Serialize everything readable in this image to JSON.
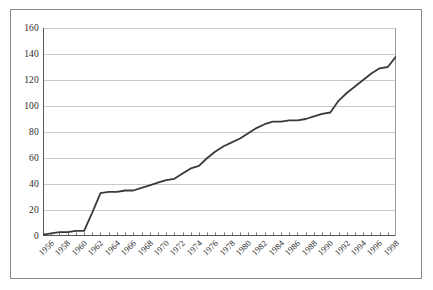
{
  "chart_data": {
    "type": "line",
    "title": "",
    "subtitle": "",
    "xlabel": "",
    "ylabel": "",
    "legend": [],
    "legend_position": "none",
    "grid": true,
    "grid_axis": "y",
    "xlim": [
      1956,
      1999
    ],
    "ylim": [
      0,
      160
    ],
    "ytick_values": [
      0,
      20,
      40,
      60,
      80,
      100,
      120,
      140,
      160
    ],
    "ytick_labels": [
      "0",
      "20",
      "40",
      "60",
      "80",
      "100",
      "120",
      "140",
      "160"
    ],
    "xtick_labels": [
      "1956",
      "1958",
      "1960",
      "1962",
      "1964",
      "1966",
      "1968",
      "1970",
      "1972",
      "1974",
      "1976",
      "1978",
      "1980",
      "1982",
      "1984",
      "1986",
      "1988",
      "1990",
      "1992",
      "1994",
      "1996",
      "1998"
    ],
    "xtick_step_years": 2,
    "minor_xticks_every_year": true,
    "line_color": "#3a3a3a",
    "grid_color": "#c9c9c9",
    "axis_color": "#555555",
    "frame_color": "#8a8a8a",
    "background_color": "#ffffff",
    "x": [
      1956,
      1957,
      1958,
      1959,
      1960,
      1961,
      1962,
      1963,
      1964,
      1965,
      1966,
      1967,
      1968,
      1969,
      1970,
      1971,
      1972,
      1973,
      1974,
      1975,
      1976,
      1977,
      1978,
      1979,
      1980,
      1981,
      1982,
      1983,
      1984,
      1985,
      1986,
      1987,
      1988,
      1989,
      1990,
      1991,
      1992,
      1993,
      1994,
      1995,
      1996,
      1997,
      1998,
      1999
    ],
    "series": [
      {
        "name": "cumulative total",
        "values": [
          1,
          2,
          3,
          3,
          4,
          4,
          18,
          33,
          34,
          34,
          35,
          35,
          37,
          39,
          41,
          43,
          44,
          48,
          52,
          54,
          60,
          65,
          69,
          72,
          75,
          79,
          83,
          86,
          88,
          88,
          89,
          89,
          90,
          92,
          94,
          95,
          104,
          110,
          115,
          120,
          125,
          129,
          130,
          138
        ]
      }
    ],
    "annotations": []
  }
}
